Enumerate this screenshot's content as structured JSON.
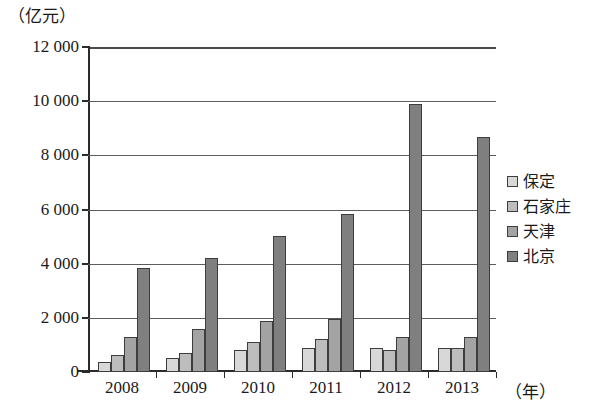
{
  "chart_data": {
    "type": "bar",
    "title": "",
    "xlabel": "（年）",
    "ylabel": "（亿元）",
    "ylim": [
      0,
      12000
    ],
    "ytick_labels": [
      "12 000",
      "10 000",
      "8 000",
      "6 000",
      "4 000",
      "2 000",
      "0"
    ],
    "ytick_values": [
      12000,
      10000,
      8000,
      6000,
      4000,
      2000,
      0
    ],
    "grid": true,
    "legend_position": "right",
    "categories": [
      "2008",
      "2009",
      "2010",
      "2011",
      "2012",
      "2013"
    ],
    "series": [
      {
        "name": "保定",
        "color": "#d8d8d8",
        "values": [
          370,
          520,
          830,
          900,
          900,
          880
        ]
      },
      {
        "name": "石家庄",
        "color": "#bdbdbd",
        "values": [
          620,
          700,
          1100,
          1220,
          800,
          900
        ]
      },
      {
        "name": "天津",
        "color": "#a3a3a3",
        "values": [
          1300,
          1600,
          1870,
          1950,
          1290,
          1310
        ]
      },
      {
        "name": "北京",
        "color": "#7f7f7f",
        "values": [
          3830,
          4200,
          5020,
          5850,
          9880,
          8680
        ]
      }
    ]
  },
  "legend": {
    "items": [
      {
        "label": "保定"
      },
      {
        "label": "石家庄"
      },
      {
        "label": "天津"
      },
      {
        "label": "北京"
      }
    ]
  }
}
